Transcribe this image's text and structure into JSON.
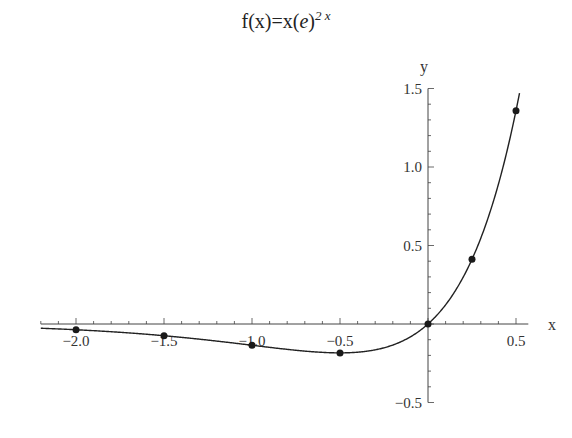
{
  "chart_data": {
    "type": "line",
    "title_parts": {
      "base": "f(x)=x(",
      "e": "e",
      "close": ")",
      "exponent": "2 x"
    },
    "xlabel": "x",
    "ylabel": "y",
    "xlim": [
      -2.2,
      0.57
    ],
    "ylim": [
      -0.5,
      1.5
    ],
    "x_ticks": [
      -2.0,
      -1.5,
      -1.0,
      -0.5,
      0.5
    ],
    "x_tick_labels": [
      "-2.0",
      "-1.5",
      "-1.0",
      "-0.5",
      "0.5"
    ],
    "y_ticks": [
      -0.5,
      0.5,
      1.0,
      1.5
    ],
    "y_tick_labels": [
      "-0.5",
      "0.5",
      "1.0",
      "1.5"
    ],
    "grid": false,
    "series": [
      {
        "name": "f(x)=x e^{2x}",
        "function": "x*exp(2x)",
        "style": "curve",
        "color": "#222222"
      }
    ],
    "points": {
      "x": [
        -2.0,
        -1.5,
        -1.0,
        -0.5,
        0.0,
        0.25,
        0.5
      ],
      "y": [
        -0.037,
        -0.075,
        -0.135,
        -0.184,
        0.0,
        0.412,
        1.359
      ]
    }
  }
}
